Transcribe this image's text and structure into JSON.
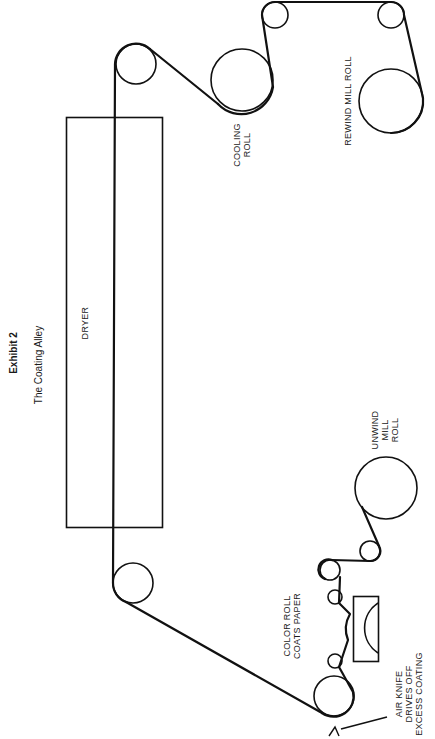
{
  "exhibit": {
    "number_label": "Exhibit 2",
    "title": "The Coating Alley"
  },
  "labels": {
    "dryer": "DRYER",
    "cooling_roll": [
      "COOLING",
      "ROLL"
    ],
    "rewind_mill_roll": "REWIND MILL ROLL",
    "unwind_mill_roll": [
      "UNWIND",
      "MILL",
      "ROLL"
    ],
    "color_roll": [
      "COLOR ROLL",
      "COATS PAPER"
    ],
    "air_knife": [
      "AIR KNIFE",
      "DRIVES OFF",
      "EXCESS COATING"
    ]
  },
  "colors": {
    "ink": "#111111",
    "background": "#ffffff"
  }
}
